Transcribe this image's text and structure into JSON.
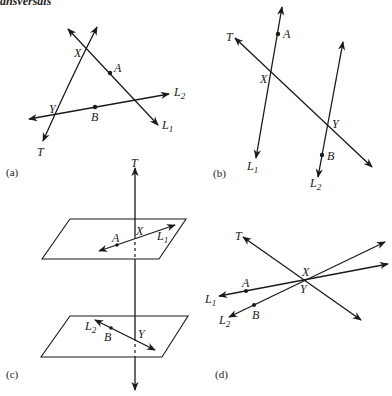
{
  "header": {
    "text": "ansversals"
  },
  "panels": [
    {
      "id": "a",
      "caption": "(a)",
      "labels": {
        "T": "T",
        "X": "X",
        "Y": "Y",
        "A": "A",
        "B": "B",
        "L1": "L",
        "L1_sub": "1",
        "L2": "L",
        "L2_sub": "2"
      }
    },
    {
      "id": "b",
      "caption": "(b)",
      "labels": {
        "T": "T",
        "X": "X",
        "Y": "Y",
        "A": "A",
        "B": "B",
        "L1": "L",
        "L1_sub": "1",
        "L2": "L",
        "L2_sub": "2"
      }
    },
    {
      "id": "c",
      "caption": "(c)",
      "labels": {
        "T": "T",
        "X": "X",
        "Y": "Y",
        "A": "A",
        "B": "B",
        "L1": "L",
        "L1_sub": "1",
        "L2": "L",
        "L2_sub": "2"
      }
    },
    {
      "id": "d",
      "caption": "(d)",
      "labels": {
        "T": "T",
        "X": "X",
        "Y": "Y",
        "A": "A",
        "B": "B",
        "L1": "L",
        "L1_sub": "1",
        "L2": "L",
        "L2_sub": "2"
      }
    }
  ],
  "colors": {
    "ink": "#1a1a1a",
    "background": "#ffffff"
  }
}
